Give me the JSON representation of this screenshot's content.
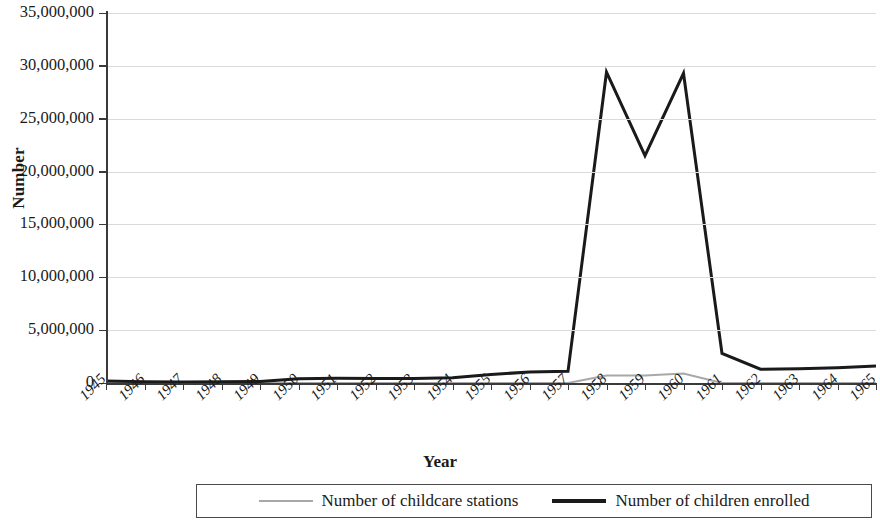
{
  "chart_data": {
    "type": "line",
    "title": "",
    "xlabel": "Year",
    "ylabel": "Number",
    "grid": true,
    "legend_position": "bottom",
    "xlim": [
      1945,
      1965
    ],
    "ylim": [
      0,
      35000000
    ],
    "ytick_values": [
      0,
      5000000,
      10000000,
      15000000,
      20000000,
      25000000,
      30000000,
      35000000
    ],
    "ytick_labels": [
      "0",
      "5,000,000",
      "10,000,000",
      "15,000,000",
      "20,000,000",
      "25,000,000",
      "30,000,000",
      "35,000,000"
    ],
    "categories": [
      1945,
      1946,
      1947,
      1948,
      1949,
      1950,
      1951,
      1952,
      1953,
      1954,
      1955,
      1956,
      1957,
      1958,
      1959,
      1960,
      1961,
      1962,
      1963,
      1964,
      1965
    ],
    "xtick_labels": [
      "1945",
      "1946",
      "1947",
      "1948",
      "1949",
      "1950",
      "1951",
      "1952",
      "1953",
      "1954",
      "1955",
      "1956",
      "1957",
      "1958",
      "1959",
      "1960",
      "1961",
      "1962",
      "1963",
      "1964",
      "1965"
    ],
    "series": [
      {
        "name": "Number of childcare stations",
        "color": "#a8a8a8",
        "line_width": 2,
        "values": [
          0,
          0,
          0,
          0,
          0,
          0,
          0,
          0,
          0,
          0,
          0,
          0,
          0,
          700000,
          700000,
          900000,
          0,
          0,
          0,
          0,
          0
        ]
      },
      {
        "name": "Number of children enrolled",
        "color": "#1a1a1a",
        "line_width": 3,
        "values": [
          180000,
          130000,
          100000,
          120000,
          150000,
          400000,
          450000,
          430000,
          420000,
          500000,
          800000,
          1050000,
          1100000,
          29400000,
          21500000,
          29300000,
          2800000,
          1300000,
          1350000,
          1450000,
          1600000
        ]
      }
    ],
    "legend": [
      {
        "label": "Number of childcare stations",
        "swatch": "stations"
      },
      {
        "label": "Number of children enrolled",
        "swatch": "enrolled"
      }
    ]
  }
}
